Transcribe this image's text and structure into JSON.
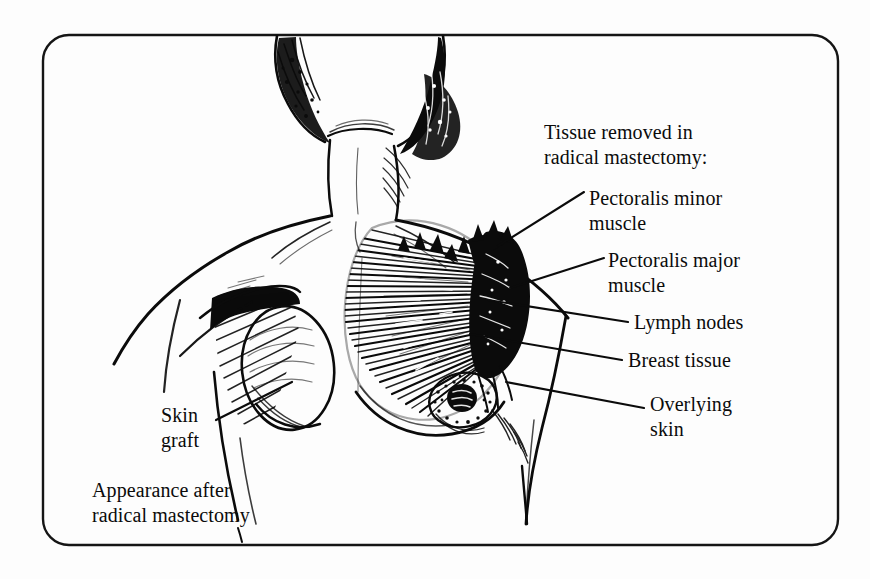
{
  "figure": {
    "style": "pen-and-ink line drawing",
    "frame": {
      "shape": "rounded-rectangle",
      "color": "#111111"
    },
    "background_color": "#fdfdfd",
    "ink_color": "#0b0b0b"
  },
  "labels": {
    "heading": "Tissue removed in\nradical mastectomy:",
    "pectoralis_minor": "Pectoralis minor\nmuscle",
    "pectoralis_major": "Pectoralis major\nmuscle",
    "lymph_nodes": "Lymph nodes",
    "breast_tissue": "Breast tissue",
    "overlying_skin": "Overlying\nskin",
    "skin_graft": "Skin\ngraft",
    "appearance": "Appearance after\nradical mastectomy"
  },
  "anatomy": {
    "regions": [
      "head-and-neck",
      "left-shoulder",
      "right-shoulder",
      "dissected-right-chest",
      "skin-graft-patch",
      "intact-breast",
      "nipple-areola",
      "axillary-lymph-mass"
    ]
  }
}
